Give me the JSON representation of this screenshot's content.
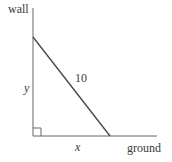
{
  "diagram": {
    "labels": {
      "wall": "wall",
      "ground": "ground",
      "hypotenuse": "10",
      "vertical_leg": "y",
      "horizontal_leg": "x"
    },
    "colors": {
      "background": "#ffffff",
      "stroke": "#555555",
      "text": "#3a3a3a"
    },
    "geometry": {
      "wall_x": 33,
      "wall_top_y": 8,
      "ground_y": 136,
      "ground_end_x": 157,
      "ladder_top": [
        33,
        37
      ],
      "ladder_foot": [
        110,
        136
      ],
      "right_angle_size": 8
    }
  }
}
